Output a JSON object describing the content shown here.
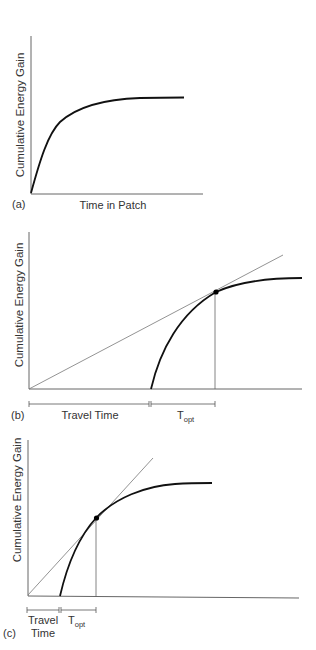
{
  "figure": {
    "panels": [
      {
        "id": "a",
        "tag": "(a)",
        "ylabel": "Cumulative Energy Gain",
        "xlabel": "Time in Patch"
      },
      {
        "id": "b",
        "tag": "(b)",
        "ylabel": "Cumulative Energy Gain",
        "travel_label": "Travel Time",
        "topt_main": "T",
        "topt_sub": "opt"
      },
      {
        "id": "c",
        "tag": "(c)",
        "ylabel": "Cumulative Energy Gain",
        "travel_label_line1": "Travel",
        "travel_label_line2": "Time",
        "topt_main": "T",
        "topt_sub": "opt"
      }
    ],
    "colors": {
      "axis": "#555555",
      "curve": "#111111",
      "tangent": "#777777",
      "text": "#333333"
    }
  }
}
